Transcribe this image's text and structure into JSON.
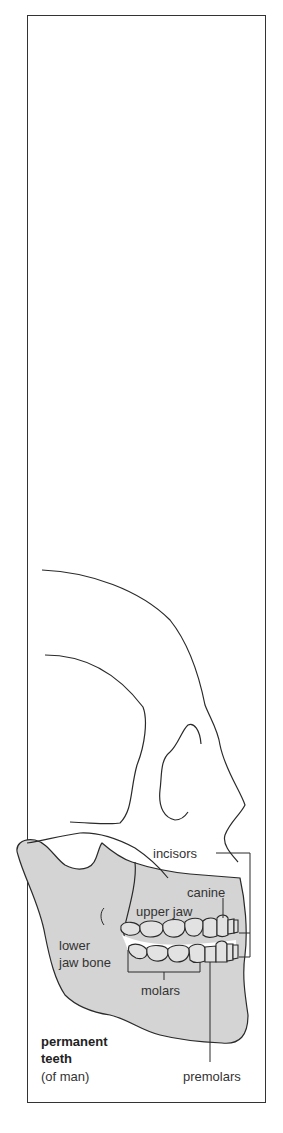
{
  "diagram": {
    "title_line1": "permanent",
    "title_line2": "teeth",
    "subtitle": "(of man)",
    "labels": {
      "incisors": "incisors",
      "canine": "canine",
      "upper_jaw": "upper jaw",
      "lower_jaw_bone_1": "lower",
      "lower_jaw_bone_2": "jaw bone",
      "molars": "molars",
      "premolars": "premolars"
    },
    "colors": {
      "line": "#2a2a2a",
      "bone_fill": "#d4d4d4",
      "tooth_fill": "#e2e2e2",
      "background": "#ffffff"
    }
  }
}
